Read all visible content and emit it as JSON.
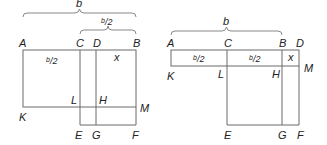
{
  "figures": [
    {
      "name": "left-figure",
      "brace_outer": {
        "label": "b",
        "x1": 23,
        "x2": 136,
        "y": 13
      },
      "brace_inner": {
        "label": "b/2",
        "x1": 80,
        "x2": 136,
        "y": 30
      },
      "points": {
        "A": "A",
        "C": "C",
        "D": "D",
        "B": "B",
        "K": "K",
        "L": "L",
        "H": "H",
        "M": "M",
        "E": "E",
        "G": "G",
        "F": "F"
      },
      "region_labels": {
        "left_square": "b/2",
        "small_square": "x"
      }
    },
    {
      "name": "right-figure",
      "brace_outer": {
        "label": "b",
        "x1": 171,
        "x2": 282,
        "y": 31
      },
      "points": {
        "A": "A",
        "C": "C",
        "B": "B",
        "D": "D",
        "K": "K",
        "L": "L",
        "H": "H",
        "M": "M",
        "E": "E",
        "G": "G",
        "F": "F"
      },
      "region_labels": {
        "rect1": "b/2",
        "rect2": "b/2",
        "small_square": "x"
      }
    }
  ],
  "colors": {
    "line": "#6b6b6b",
    "text": "#222222",
    "background": "#ffffff"
  }
}
